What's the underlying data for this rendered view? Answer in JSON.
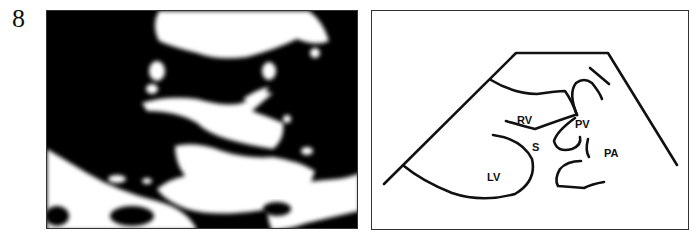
{
  "figure": {
    "number": "8",
    "left_panel": {
      "type": "echocardiogram-image"
    },
    "right_panel": {
      "type": "line-diagram",
      "labels": {
        "rv": "RV",
        "pv": "PV",
        "s": "S",
        "pa": "PA",
        "lv": "LV"
      }
    }
  }
}
